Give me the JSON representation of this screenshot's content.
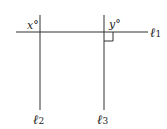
{
  "diagram": {
    "lines": [
      {
        "id": "l1",
        "label": "ℓ",
        "subscript": "1",
        "orientation": "horizontal"
      },
      {
        "id": "l2",
        "label": "ℓ",
        "subscript": "2",
        "orientation": "vertical"
      },
      {
        "id": "l3",
        "label": "ℓ",
        "subscript": "3",
        "orientation": "vertical"
      }
    ],
    "angles": [
      {
        "label": "x°",
        "at": "intersection of l1 and l2"
      },
      {
        "label": "y°",
        "at": "intersection of l1 and l3"
      }
    ],
    "right_angle_marker": "intersection of l1 and l3",
    "colors": {
      "stroke": "#333333",
      "text": "#222222"
    }
  }
}
